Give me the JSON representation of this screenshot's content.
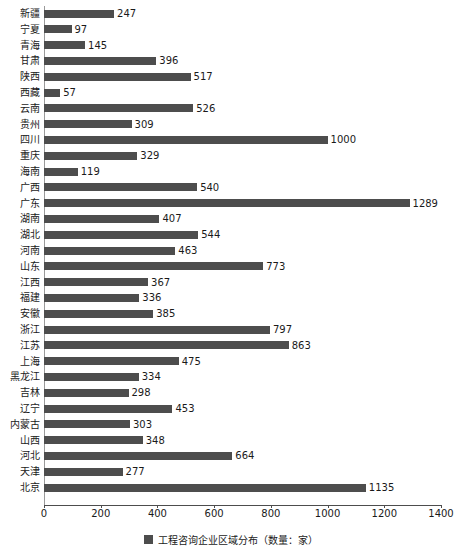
{
  "chart_data": {
    "type": "bar",
    "orientation": "horizontal",
    "title": "",
    "subtitle": "",
    "xlabel": "",
    "ylabel": "",
    "xlim": [
      0,
      1400
    ],
    "xticks": [
      0,
      200,
      400,
      600,
      800,
      1000,
      1200,
      1400
    ],
    "grid": false,
    "legend_position": "bottom",
    "series_name": "工程咨询企业区域分布（数量：家）",
    "bar_color": "#4d4d4d",
    "categories": [
      "新疆",
      "宁夏",
      "青海",
      "甘肃",
      "陕西",
      "西藏",
      "云南",
      "贵州",
      "四川",
      "重庆",
      "海南",
      "广西",
      "广东",
      "湖南",
      "湖北",
      "河南",
      "山东",
      "江西",
      "福建",
      "安徽",
      "浙江",
      "江苏",
      "上海",
      "黑龙江",
      "吉林",
      "辽宁",
      "内蒙古",
      "山西",
      "河北",
      "天津",
      "北京"
    ],
    "values": [
      247,
      97,
      145,
      396,
      517,
      57,
      526,
      309,
      1000,
      329,
      119,
      540,
      1289,
      407,
      544,
      463,
      773,
      367,
      336,
      385,
      797,
      863,
      475,
      334,
      298,
      453,
      303,
      348,
      664,
      277,
      1135
    ]
  },
  "legend": {
    "label": "工程咨询企业区域分布（数量：家）",
    "swatch_color": "#4d4d4d"
  }
}
